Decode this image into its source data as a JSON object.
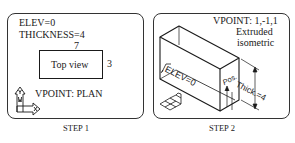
{
  "step1": {
    "elev_label": "ELEV=0",
    "thickness_label": "THICKNESS=4",
    "width_dim": "7",
    "height_dim": "3",
    "rect_label": "Top view",
    "vpoint_label": "VPOINT: PLAN",
    "ucs_icon": "ucs-xy-icon",
    "caption": "STEP 1"
  },
  "step2": {
    "vpoint_label": "VPOINT: 1,-1,1",
    "desc_line1": "Extruded",
    "desc_line2": "isometric",
    "elev_label": "ELEV=0",
    "pos_label": "Pos.",
    "thick_label": "Thick.=4",
    "ucs_icon": "ucs-isometric-icon",
    "caption": "STEP 2"
  },
  "colors": {
    "line": "#1a1a1a",
    "border": "#333333",
    "background": "#ffffff"
  }
}
